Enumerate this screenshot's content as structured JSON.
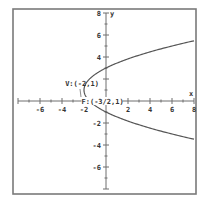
{
  "chart_data": {
    "type": "line",
    "title": "",
    "xlabel": "x",
    "ylabel": "y",
    "xlim": [
      -8,
      8
    ],
    "ylim": [
      -8,
      8
    ],
    "grid": false,
    "x_ticks": [
      -8,
      -7,
      -6,
      -5,
      -4,
      -3,
      -2,
      -1,
      1,
      2,
      3,
      4,
      5,
      6,
      7,
      8
    ],
    "y_ticks": [
      -8,
      -7,
      -6,
      -5,
      -4,
      -3,
      -2,
      -1,
      1,
      2,
      3,
      4,
      5,
      6,
      7,
      8
    ],
    "x_tick_labels": [
      {
        "value": -6,
        "text": "-6"
      },
      {
        "value": -4,
        "text": "-4"
      },
      {
        "value": -2,
        "text": "-2"
      },
      {
        "value": 2,
        "text": "2"
      },
      {
        "value": 4,
        "text": "4"
      },
      {
        "value": 6,
        "text": "6"
      },
      {
        "value": 8,
        "text": "8"
      }
    ],
    "y_tick_labels": [
      {
        "value": 8,
        "text": "8"
      },
      {
        "value": 6,
        "text": "6"
      },
      {
        "value": 4,
        "text": "4"
      },
      {
        "value": -2,
        "text": "-2"
      },
      {
        "value": -4,
        "text": "-4"
      },
      {
        "value": -6,
        "text": "-6"
      }
    ],
    "series": [
      {
        "name": "parabola",
        "equation": "(y-1)^2 = 2(x+2)",
        "vertex": [
          -2,
          1
        ],
        "p": 0.5,
        "x_range": [
          -2,
          8
        ]
      }
    ],
    "annotations": [
      {
        "name": "vertex",
        "text": "V:(-2,1)",
        "point": [
          -2,
          1
        ]
      },
      {
        "name": "focus",
        "text": "F:(-3/2,1)",
        "point": [
          -1.5,
          1
        ]
      }
    ]
  }
}
